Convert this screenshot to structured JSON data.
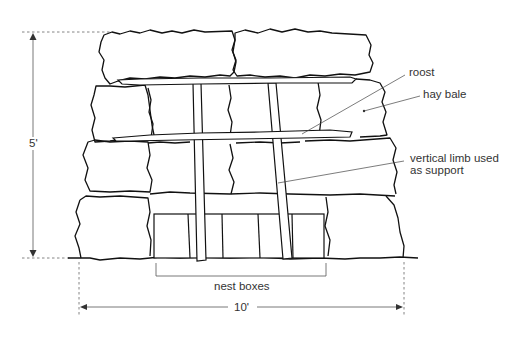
{
  "diagram": {
    "labels": {
      "roost": "roost",
      "hay_bale": "hay bale",
      "vertical_limb_line1": "vertical limb used",
      "vertical_limb_line2": "as support",
      "nest_boxes": "nest boxes",
      "height_dimension": "5'",
      "width_dimension": "10'"
    },
    "structure": {
      "bale_rows": 4,
      "top_row_bales": 2,
      "roost_count": 2,
      "vertical_limbs": 2,
      "nest_box_count": 6
    },
    "colors": {
      "line": "#111111",
      "text": "#333333",
      "background": "#ffffff"
    }
  }
}
